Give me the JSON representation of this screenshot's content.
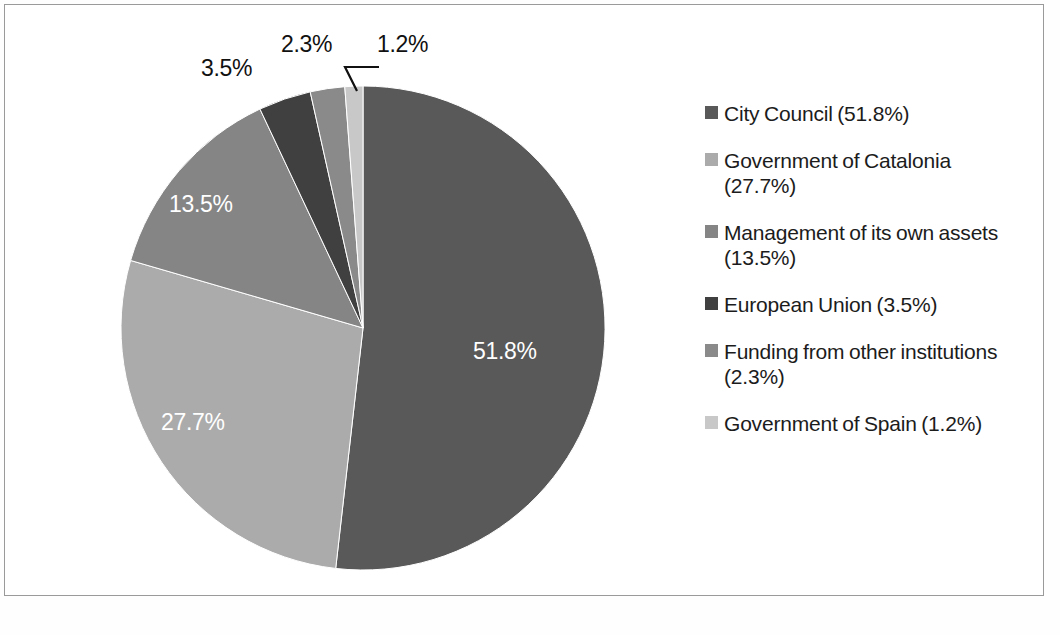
{
  "chart_data": {
    "type": "pie",
    "title": "",
    "subtitle": "",
    "xlabel": "",
    "ylabel": "",
    "units": "percent",
    "legend_position": "right",
    "grid": false,
    "start_angle_deg": 0,
    "direction": "clockwise",
    "total": 100.0,
    "categories": [
      "City Council",
      "Government of Catalonia",
      "Management of its own assets",
      "European Union",
      "Funding from other institutions",
      "Government of Spain"
    ],
    "values": [
      51.8,
      27.7,
      13.5,
      3.5,
      2.3,
      1.2
    ],
    "colors": [
      "#595959",
      "#ababab",
      "#858585",
      "#404040",
      "#8a8a8a",
      "#c8c8c8"
    ],
    "slices": [
      {
        "name": "City Council",
        "value": 51.8,
        "value_label": "51.8%",
        "legend_label": "City Council (51.8%)",
        "color": "#595959",
        "label_placement": "inside",
        "label_color": "#ffffff"
      },
      {
        "name": "Government of Catalonia",
        "value": 27.7,
        "value_label": "27.7%",
        "legend_label": "Government of Catalonia (27.7%)",
        "color": "#ababab",
        "label_placement": "inside",
        "label_color": "#ffffff"
      },
      {
        "name": "Management of its own assets",
        "value": 13.5,
        "value_label": "13.5%",
        "legend_label": "Management of its own assets (13.5%)",
        "color": "#858585",
        "label_placement": "inside",
        "label_color": "#ffffff"
      },
      {
        "name": "European Union",
        "value": 3.5,
        "value_label": "3.5%",
        "legend_label": "European Union (3.5%)",
        "color": "#404040",
        "label_placement": "outside",
        "label_color": "#111111"
      },
      {
        "name": "Funding from other institutions",
        "value": 2.3,
        "value_label": "2.3%",
        "legend_label": "Funding from other institutions (2.3%)",
        "color": "#8a8a8a",
        "label_placement": "outside",
        "label_color": "#111111"
      },
      {
        "name": "Government of Spain",
        "value": 1.2,
        "value_label": "1.2%",
        "legend_label": "Government of Spain (1.2%)",
        "color": "#c8c8c8",
        "label_placement": "outside-leader",
        "label_color": "#111111"
      }
    ]
  },
  "legend": {
    "items": [
      {
        "label": "City Council (51.8%)"
      },
      {
        "label": "Government of Catalonia (27.7%)"
      },
      {
        "label": "Management of its own assets (13.5%)"
      },
      {
        "label": "European Union (3.5%)"
      },
      {
        "label": "Funding from other institutions (2.3%)"
      },
      {
        "label": "Government of Spain (1.2%)"
      }
    ]
  },
  "callouts": {
    "eu": "3.5%",
    "other_funding": "2.3%",
    "spain": "1.2%"
  },
  "inner_labels": {
    "city_council": "51.8%",
    "catalonia": "27.7%",
    "own_assets": "13.5%"
  },
  "geometry": {
    "center_x": 358,
    "center_y": 323,
    "radius": 242
  }
}
